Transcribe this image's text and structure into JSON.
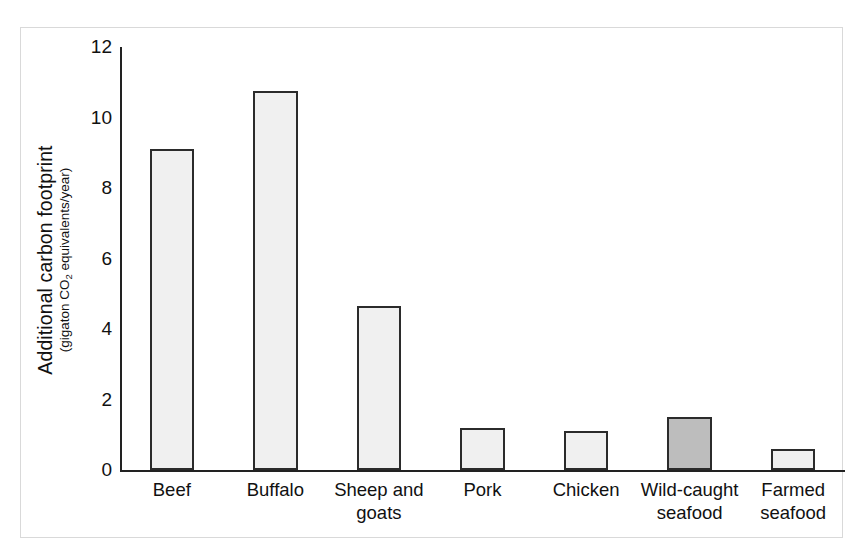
{
  "figure": {
    "frame_color": "#d9d9d9",
    "background": "#ffffff"
  },
  "axis": {
    "y_title_main": "Additional carbon footprint",
    "y_title_sub_pre": "(gigaton CO",
    "y_title_sub_subscript": "2",
    "y_title_sub_post": " equivalents/year)",
    "y_ticks": [
      "0",
      "2",
      "4",
      "6",
      "8",
      "10",
      "12"
    ]
  },
  "chart_data": {
    "type": "bar",
    "title": "",
    "xlabel": "",
    "ylabel": "Additional carbon footprint (gigaton CO2 equivalents/year)",
    "categories": [
      "Beef",
      "Buffalo",
      "Sheep and goats",
      "Pork",
      "Chicken",
      "Wild-caught seafood",
      "Farmed seafood"
    ],
    "category_lines": [
      [
        "Beef"
      ],
      [
        "Buffalo"
      ],
      [
        "Sheep and",
        "goats"
      ],
      [
        "Pork"
      ],
      [
        "Chicken"
      ],
      [
        "Wild-caught",
        "seafood"
      ],
      [
        "Farmed",
        "seafood"
      ]
    ],
    "values": [
      9.1,
      10.75,
      4.65,
      1.2,
      1.1,
      1.5,
      0.6
    ],
    "ylim": [
      0,
      12
    ],
    "ytick_step": 2,
    "grid": false,
    "legend": "none",
    "bar_colors": [
      "#f0f0f0",
      "#f0f0f0",
      "#f0f0f0",
      "#f0f0f0",
      "#f0f0f0",
      "#bdbdbd",
      "#f0f0f0"
    ],
    "bar_edge_color": "#2b2b2b",
    "highlight_index": 5,
    "highlight_color": "#bdbdbd",
    "default_color": "#f0f0f0"
  }
}
